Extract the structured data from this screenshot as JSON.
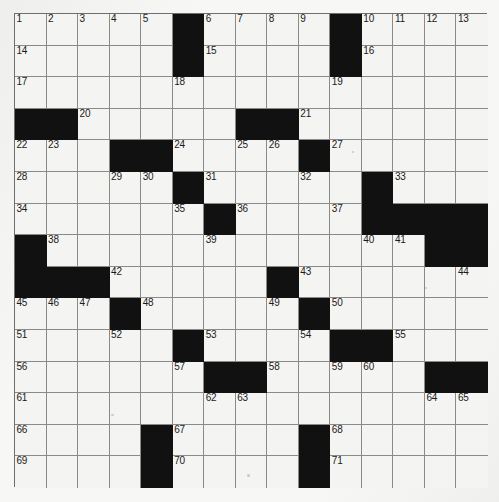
{
  "document": {
    "type": "crossword-puzzle-grid",
    "title": "Crossword Puzzle Grid",
    "rows": 15,
    "columns": 15,
    "colors": {
      "paper": "#f7f7f5",
      "cell_fill": "#f4f4f2",
      "block_fill": "#111111",
      "grid_line": "#8a8a8a",
      "border": "#6e6e6e",
      "number_text": "#1a1a1a"
    },
    "grid": {
      "legend": {
        "0": "white (fillable) square",
        "1": "black (blocked) square"
      },
      "blocks": [
        [
          0,
          0,
          0,
          0,
          0,
          1,
          0,
          0,
          0,
          0,
          1,
          0,
          0,
          0,
          0
        ],
        [
          0,
          0,
          0,
          0,
          0,
          1,
          0,
          0,
          0,
          0,
          1,
          0,
          0,
          0,
          0
        ],
        [
          0,
          0,
          0,
          0,
          0,
          0,
          0,
          0,
          0,
          0,
          0,
          0,
          0,
          0,
          0
        ],
        [
          1,
          1,
          0,
          0,
          0,
          0,
          0,
          1,
          1,
          0,
          0,
          0,
          0,
          0,
          0
        ],
        [
          0,
          0,
          0,
          1,
          1,
          0,
          0,
          0,
          0,
          1,
          0,
          0,
          0,
          0,
          0
        ],
        [
          0,
          0,
          0,
          0,
          0,
          1,
          0,
          0,
          0,
          0,
          0,
          1,
          0,
          0,
          0
        ],
        [
          0,
          0,
          0,
          0,
          0,
          0,
          1,
          0,
          0,
          0,
          0,
          1,
          1,
          1,
          1
        ],
        [
          1,
          0,
          0,
          0,
          0,
          0,
          0,
          0,
          0,
          0,
          0,
          0,
          0,
          1,
          1
        ],
        [
          1,
          1,
          1,
          0,
          0,
          0,
          0,
          0,
          1,
          0,
          0,
          0,
          0,
          0,
          0
        ],
        [
          0,
          0,
          0,
          1,
          0,
          0,
          0,
          0,
          0,
          1,
          0,
          0,
          0,
          0,
          0
        ],
        [
          0,
          0,
          0,
          0,
          0,
          1,
          0,
          0,
          0,
          0,
          1,
          1,
          0,
          0,
          0
        ],
        [
          0,
          0,
          0,
          0,
          0,
          0,
          1,
          1,
          0,
          0,
          0,
          0,
          0,
          1,
          1
        ],
        [
          0,
          0,
          0,
          0,
          0,
          0,
          0,
          0,
          0,
          0,
          0,
          0,
          0,
          0,
          0
        ],
        [
          0,
          0,
          0,
          0,
          1,
          0,
          0,
          0,
          0,
          1,
          0,
          0,
          0,
          0,
          0
        ],
        [
          0,
          0,
          0,
          0,
          1,
          0,
          0,
          0,
          0,
          1,
          0,
          0,
          0,
          0,
          0
        ]
      ],
      "numbers": [
        {
          "row": 0,
          "col": 0,
          "label": "1"
        },
        {
          "row": 0,
          "col": 1,
          "label": "2"
        },
        {
          "row": 0,
          "col": 2,
          "label": "3"
        },
        {
          "row": 0,
          "col": 3,
          "label": "4"
        },
        {
          "row": 0,
          "col": 4,
          "label": "5"
        },
        {
          "row": 0,
          "col": 6,
          "label": "6"
        },
        {
          "row": 0,
          "col": 7,
          "label": "7"
        },
        {
          "row": 0,
          "col": 8,
          "label": "8"
        },
        {
          "row": 0,
          "col": 9,
          "label": "9"
        },
        {
          "row": 0,
          "col": 11,
          "label": "10"
        },
        {
          "row": 0,
          "col": 12,
          "label": "11"
        },
        {
          "row": 0,
          "col": 13,
          "label": "12"
        },
        {
          "row": 0,
          "col": 14,
          "label": "13"
        },
        {
          "row": 1,
          "col": 0,
          "label": "14"
        },
        {
          "row": 1,
          "col": 6,
          "label": "15"
        },
        {
          "row": 1,
          "col": 11,
          "label": "16"
        },
        {
          "row": 2,
          "col": 0,
          "label": "17"
        },
        {
          "row": 2,
          "col": 5,
          "label": "18"
        },
        {
          "row": 2,
          "col": 10,
          "label": "19"
        },
        {
          "row": 3,
          "col": 2,
          "label": "20"
        },
        {
          "row": 3,
          "col": 9,
          "label": "21"
        },
        {
          "row": 4,
          "col": 0,
          "label": "22"
        },
        {
          "row": 4,
          "col": 1,
          "label": "23"
        },
        {
          "row": 4,
          "col": 5,
          "label": "24"
        },
        {
          "row": 4,
          "col": 7,
          "label": "25"
        },
        {
          "row": 4,
          "col": 8,
          "label": "26"
        },
        {
          "row": 4,
          "col": 10,
          "label": "27"
        },
        {
          "row": 5,
          "col": 0,
          "label": "28"
        },
        {
          "row": 5,
          "col": 3,
          "label": "29"
        },
        {
          "row": 5,
          "col": 4,
          "label": "30"
        },
        {
          "row": 5,
          "col": 6,
          "label": "31"
        },
        {
          "row": 5,
          "col": 9,
          "label": "32"
        },
        {
          "row": 5,
          "col": 12,
          "label": "33"
        },
        {
          "row": 6,
          "col": 0,
          "label": "34"
        },
        {
          "row": 6,
          "col": 5,
          "label": "35"
        },
        {
          "row": 6,
          "col": 7,
          "label": "36"
        },
        {
          "row": 6,
          "col": 10,
          "label": "37"
        },
        {
          "row": 7,
          "col": 1,
          "label": "38"
        },
        {
          "row": 7,
          "col": 6,
          "label": "39"
        },
        {
          "row": 7,
          "col": 11,
          "label": "40"
        },
        {
          "row": 7,
          "col": 12,
          "label": "41"
        },
        {
          "row": 8,
          "col": 3,
          "label": "42"
        },
        {
          "row": 8,
          "col": 9,
          "label": "43"
        },
        {
          "row": 8,
          "col": 14,
          "label": "44"
        },
        {
          "row": 9,
          "col": 0,
          "label": "45"
        },
        {
          "row": 9,
          "col": 1,
          "label": "46"
        },
        {
          "row": 9,
          "col": 2,
          "label": "47"
        },
        {
          "row": 9,
          "col": 4,
          "label": "48"
        },
        {
          "row": 9,
          "col": 8,
          "label": "49"
        },
        {
          "row": 9,
          "col": 10,
          "label": "50"
        },
        {
          "row": 10,
          "col": 0,
          "label": "51"
        },
        {
          "row": 10,
          "col": 3,
          "label": "52"
        },
        {
          "row": 10,
          "col": 6,
          "label": "53"
        },
        {
          "row": 10,
          "col": 9,
          "label": "54"
        },
        {
          "row": 10,
          "col": 12,
          "label": "55"
        },
        {
          "row": 11,
          "col": 0,
          "label": "56"
        },
        {
          "row": 11,
          "col": 5,
          "label": "57"
        },
        {
          "row": 11,
          "col": 8,
          "label": "58"
        },
        {
          "row": 11,
          "col": 10,
          "label": "59"
        },
        {
          "row": 11,
          "col": 11,
          "label": "60"
        },
        {
          "row": 12,
          "col": 0,
          "label": "61"
        },
        {
          "row": 12,
          "col": 6,
          "label": "62"
        },
        {
          "row": 12,
          "col": 7,
          "label": "63"
        },
        {
          "row": 12,
          "col": 13,
          "label": "64"
        },
        {
          "row": 12,
          "col": 14,
          "label": "65"
        },
        {
          "row": 13,
          "col": 0,
          "label": "66"
        },
        {
          "row": 13,
          "col": 5,
          "label": "67"
        },
        {
          "row": 13,
          "col": 10,
          "label": "68"
        },
        {
          "row": 14,
          "col": 0,
          "label": "69"
        },
        {
          "row": 14,
          "col": 5,
          "label": "70"
        },
        {
          "row": 14,
          "col": 10,
          "label": "71"
        }
      ],
      "entries": []
    }
  }
}
